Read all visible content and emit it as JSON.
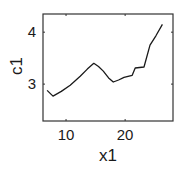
{
  "chart_data": {
    "type": "line",
    "title": "",
    "xlabel": "x1",
    "ylabel": "c1",
    "xlim": [
      6.1,
      28.1
    ],
    "ylim": [
      2.29,
      4.35
    ],
    "xticks": [
      10,
      20
    ],
    "yticks": [
      3,
      4
    ],
    "grid": false,
    "legend": null,
    "series": [
      {
        "name": "c1",
        "color": "#1a1a1a",
        "x": [
          6.8,
          7.8,
          9.2,
          10.7,
          12.4,
          13.6,
          14.7,
          15.5,
          16.3,
          17.2,
          18.0,
          18.9,
          19.8,
          21.2,
          21.7,
          23.2,
          24.2,
          25.2,
          26.3
        ],
        "y": [
          2.88,
          2.77,
          2.86,
          2.98,
          3.15,
          3.29,
          3.4,
          3.34,
          3.25,
          3.12,
          3.04,
          3.08,
          3.13,
          3.17,
          3.31,
          3.33,
          3.75,
          3.93,
          4.15
        ]
      }
    ]
  },
  "axes": {
    "x_tick_labels": [
      "10",
      "20"
    ],
    "y_tick_labels": [
      "3",
      "4"
    ],
    "xlabel": "x1",
    "ylabel": "c1"
  }
}
